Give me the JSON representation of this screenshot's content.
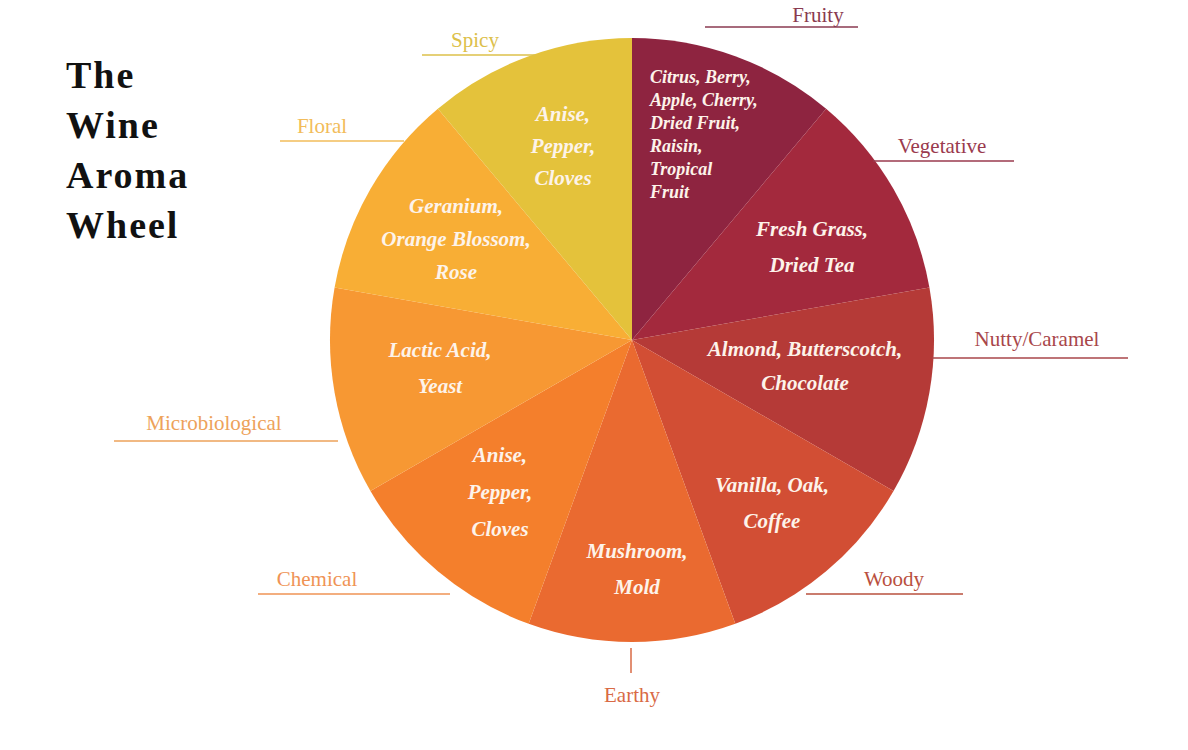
{
  "title": {
    "lines": [
      "The",
      "Wine",
      "Aroma",
      "Wheel"
    ]
  },
  "chart_data": {
    "type": "pie",
    "title": "The Wine Aroma Wheel",
    "start_angle_deg": 0,
    "direction": "clockwise",
    "categories": [
      "Fruity",
      "Vegetative",
      "Nutty/Caramel",
      "Woody",
      "Earthy",
      "Chemical",
      "Microbiological",
      "Floral",
      "Spicy"
    ],
    "values": [
      40,
      40,
      40,
      40,
      40,
      40,
      40,
      40,
      40
    ],
    "slices": [
      {
        "name": "Fruity",
        "aromas": [
          "Citrus, Berry,",
          "Apple, Cherry,",
          "Dried Fruit,",
          "Raisin,",
          "Tropical",
          "Fruit"
        ],
        "color": "#8e2440",
        "label_color": "#8a3a50"
      },
      {
        "name": "Vegetative",
        "aromas": [
          "Fresh Grass,",
          "Dried Tea"
        ],
        "color": "#a3293d",
        "label_color": "#9a3a4e"
      },
      {
        "name": "Nutty/Caramel",
        "aromas": [
          "Almond, Butterscotch,",
          "Chocolate"
        ],
        "color": "#b53a37",
        "label_color": "#a8464a"
      },
      {
        "name": "Woody",
        "aromas": [
          "Vanilla, Oak,",
          "Coffee"
        ],
        "color": "#d24e34",
        "label_color": "#b9503e"
      },
      {
        "name": "Earthy",
        "aromas": [
          "Mushroom,",
          "Mold"
        ],
        "color": "#ea6a30",
        "label_color": "#d96a45"
      },
      {
        "name": "Chemical",
        "aromas": [
          "Anise,",
          "Pepper,",
          "Cloves"
        ],
        "color": "#f47f2c",
        "label_color": "#ef9355"
      },
      {
        "name": "Microbiological",
        "aromas": [
          "Lactic Acid,",
          "Yeast"
        ],
        "color": "#f79833",
        "label_color": "#eda25a"
      },
      {
        "name": "Floral",
        "aromas": [
          "Geranium,",
          "Orange Blossom,",
          "Rose"
        ],
        "color": "#f8ae35",
        "label_color": "#f2bc5a"
      },
      {
        "name": "Spicy",
        "aromas": [
          "Anise,",
          "Pepper,",
          "Cloves"
        ],
        "color": "#e4c23b",
        "label_color": "#dcc04a"
      }
    ],
    "legend": "none",
    "grid": false
  }
}
